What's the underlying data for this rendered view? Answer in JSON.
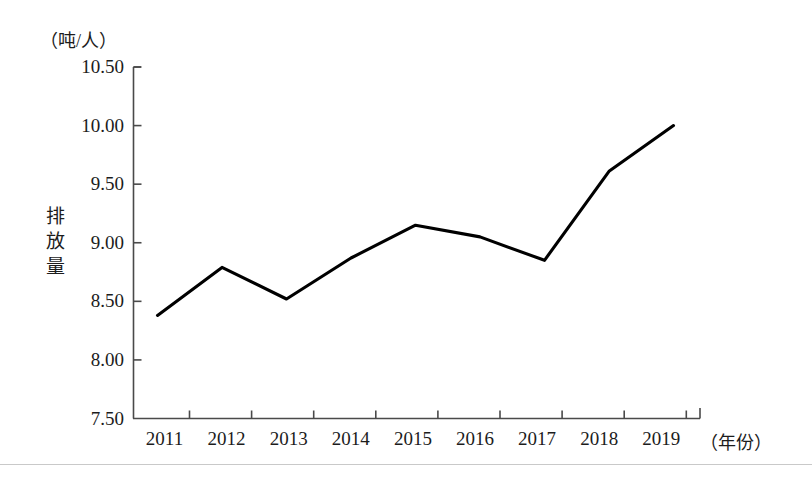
{
  "chart_data": {
    "type": "line",
    "title": "",
    "subtitle": "",
    "unit_label": "（吨/人）",
    "ylabel": "排放量",
    "xlabel": "（年份）",
    "categories": [
      "2011",
      "2012",
      "2013",
      "2014",
      "2015",
      "2016",
      "2017",
      "2018",
      "2019"
    ],
    "values": [
      8.38,
      8.79,
      8.52,
      8.87,
      9.15,
      9.05,
      8.85,
      9.61,
      10.0
    ],
    "series": [
      {
        "name": "排放量",
        "values": [
          8.38,
          8.79,
          8.52,
          8.87,
          9.15,
          9.05,
          8.85,
          9.61,
          10.0
        ]
      }
    ],
    "ylim": [
      7.5,
      10.5
    ],
    "ytick_labels": [
      "10.50",
      "10.00",
      "9.50",
      "9.00",
      "8.50",
      "8.00",
      "7.50"
    ],
    "ytick_values": [
      10.5,
      10.0,
      9.5,
      9.0,
      8.5,
      8.0,
      7.5
    ],
    "ytick_step": 0.5,
    "grid": false,
    "legend": false,
    "legend_position": "none",
    "line_color": "#000000",
    "line_width": 3,
    "markers": false,
    "axis_color": "#4a4a4a"
  },
  "colors": {
    "background": "#ffffff",
    "line": "#000000",
    "axis": "#4a4a4a",
    "text": "#1c1c1c"
  }
}
